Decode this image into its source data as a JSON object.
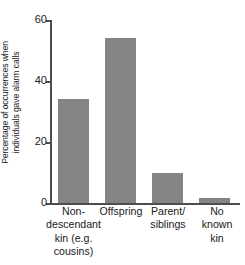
{
  "chart_data": {
    "type": "bar",
    "title": "",
    "xlabel": "",
    "ylabel": "Percentage of occurrences when individuals gave alarm calls",
    "ylabel_lines": [
      "Percentage of occurrences when",
      "individuals gave alarm calls"
    ],
    "categories": [
      "Non-descendant kin (e.g. cousins)",
      "Offspring",
      "Parent/siblings",
      "No known kin"
    ],
    "category_lines": [
      [
        "Non-",
        "descendant",
        "kin (e.g.",
        "cousins)"
      ],
      [
        "Offspring"
      ],
      [
        "Parent/",
        "siblings"
      ],
      [
        "No",
        "known",
        "kin"
      ]
    ],
    "values": [
      34,
      54,
      10,
      1.5
    ],
    "ylim": [
      0,
      60
    ],
    "yticks": [
      0,
      20,
      40,
      60
    ],
    "ytick_labels": [
      "0",
      "20",
      "40",
      "60"
    ],
    "grid": false,
    "legend": false,
    "bar_color": "#848484",
    "axis_color": "#4d4d4d",
    "background": "#ffffff"
  }
}
